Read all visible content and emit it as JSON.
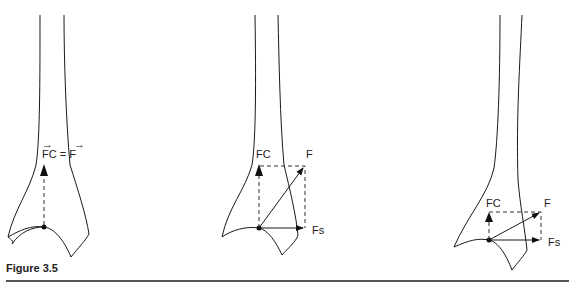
{
  "figure": {
    "caption": "Figure 3.5",
    "panels": [
      {
        "labels": {
          "eq": "FC = F"
        }
      },
      {
        "labels": {
          "fc": "FC",
          "f": "F",
          "fs": "Fs"
        }
      },
      {
        "labels": {
          "fc": "FC",
          "f": "F",
          "fs": "Fs"
        }
      }
    ],
    "arrow_glyph": "→"
  }
}
